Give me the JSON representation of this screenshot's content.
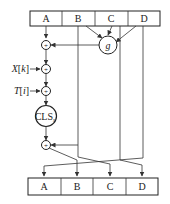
{
  "diagram": {
    "type": "MD5 round operation",
    "top_registers": [
      "A",
      "B",
      "C",
      "D"
    ],
    "bottom_registers": [
      "A",
      "B",
      "C",
      "D"
    ],
    "function_node": "g",
    "adders": [
      "+",
      "+",
      "+",
      "+"
    ],
    "inputs": {
      "message_word": "X[k]",
      "message_word_base": "X",
      "message_word_index": "k",
      "constant": "T[i]",
      "constant_base": "T",
      "constant_index": "i"
    },
    "shift_node": "CLS",
    "shift_subscript": "s",
    "colors": {
      "line": "#333333",
      "background": "#ffffff"
    }
  }
}
